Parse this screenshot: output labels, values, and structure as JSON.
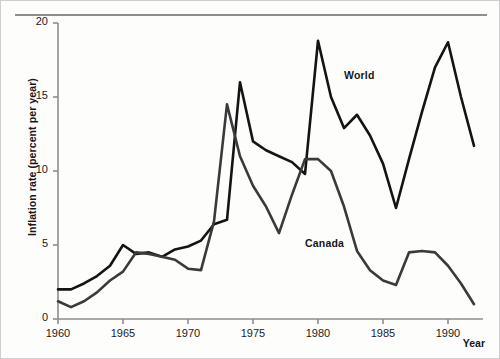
{
  "chart_data": {
    "type": "line",
    "title": "",
    "xlabel": "Year",
    "ylabel": "Inflation rate (percent per year)",
    "xlim": [
      1960,
      1992
    ],
    "ylim": [
      0,
      20
    ],
    "grid": false,
    "legend_position": "inline-annotations",
    "xticks": [
      "1960",
      "1965",
      "1970",
      "1975",
      "1980",
      "1985",
      "1990"
    ],
    "xtick_values": [
      1960,
      1965,
      1970,
      1975,
      1980,
      1985,
      1990
    ],
    "yticks": [
      "0",
      "5",
      "10",
      "15",
      "20"
    ],
    "ytick_values": [
      0,
      5,
      10,
      15,
      20
    ],
    "x": [
      1960,
      1961,
      1962,
      1963,
      1964,
      1965,
      1966,
      1967,
      1968,
      1969,
      1970,
      1971,
      1972,
      1973,
      1974,
      1975,
      1976,
      1977,
      1978,
      1979,
      1980,
      1981,
      1982,
      1983,
      1984,
      1985,
      1986,
      1987,
      1988,
      1989,
      1990,
      1991,
      1992
    ],
    "series": [
      {
        "name": "World",
        "color": "#141414",
        "values": [
          2.0,
          2.0,
          2.4,
          2.9,
          3.6,
          5.0,
          4.4,
          4.5,
          4.2,
          4.7,
          4.9,
          5.3,
          6.4,
          6.7,
          16.0,
          12.0,
          11.4,
          11.0,
          10.6,
          9.8,
          18.8,
          15.0,
          12.9,
          13.8,
          12.4,
          10.5,
          7.5,
          10.8,
          14.0,
          17.0,
          18.7,
          15.0,
          11.7
        ]
      },
      {
        "name": "Canada",
        "color": "#3a3a3a",
        "values": [
          1.2,
          0.8,
          1.2,
          1.8,
          2.6,
          3.2,
          4.5,
          4.4,
          4.2,
          4.0,
          3.4,
          3.3,
          6.6,
          14.5,
          11.0,
          9.0,
          7.6,
          5.8,
          8.4,
          10.8,
          10.8,
          10.0,
          7.6,
          4.6,
          3.3,
          2.6,
          2.3,
          4.5,
          4.6,
          4.5,
          3.6,
          2.4,
          1.0
        ]
      }
    ],
    "annotations": [
      {
        "text": "World",
        "x": 1982,
        "y": 16.4
      },
      {
        "text": "Canada",
        "x": 1979,
        "y": 5.1
      }
    ]
  }
}
